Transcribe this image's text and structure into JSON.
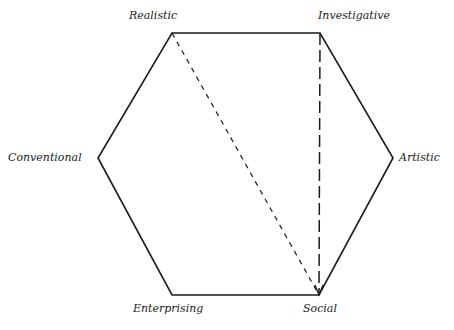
{
  "diagram": {
    "type": "hexagon",
    "labels": {
      "realistic": "Realistic",
      "investigative": "Investigative",
      "artistic": "Artistic",
      "social": "Social",
      "enterprising": "Enterprising",
      "conventional": "Conventional"
    },
    "vertices": [
      {
        "name": "Realistic",
        "x": 172,
        "y": 33
      },
      {
        "name": "Investigative",
        "x": 320,
        "y": 33
      },
      {
        "name": "Artistic",
        "x": 393,
        "y": 158
      },
      {
        "name": "Social",
        "x": 319,
        "y": 295
      },
      {
        "name": "Enterprising",
        "x": 172,
        "y": 295
      },
      {
        "name": "Conventional",
        "x": 98,
        "y": 158
      }
    ],
    "connections": [
      {
        "from": "Realistic",
        "to": "Social",
        "style": "short-dash"
      },
      {
        "from": "Investigative",
        "to": "Social",
        "style": "long-dash",
        "arrow": true
      }
    ],
    "colors": {
      "line": "#1a1a1a",
      "background": "#ffffff"
    }
  }
}
